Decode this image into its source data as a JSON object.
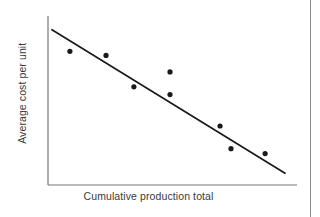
{
  "chart_data": {
    "type": "scatter",
    "title": "",
    "xlabel": "Cumulative production total",
    "ylabel": "Average cost per unit",
    "grid": false,
    "legend": null,
    "axes": {
      "x_ticks": [],
      "y_ticks": [],
      "xlim": [
        0,
        1
      ],
      "ylim": [
        0,
        1
      ],
      "spines": [
        "left",
        "bottom"
      ]
    },
    "points": [
      {
        "x": 0.088,
        "y": 0.791
      },
      {
        "x": 0.233,
        "y": 0.767
      },
      {
        "x": 0.345,
        "y": 0.581
      },
      {
        "x": 0.49,
        "y": 0.669
      },
      {
        "x": 0.49,
        "y": 0.535
      },
      {
        "x": 0.691,
        "y": 0.349
      },
      {
        "x": 0.735,
        "y": 0.215
      },
      {
        "x": 0.872,
        "y": 0.186
      }
    ],
    "trend_line": {
      "kind": "linear-fit",
      "start": {
        "x": 0.016,
        "y": 0.919
      },
      "end": {
        "x": 0.952,
        "y": 0.07
      },
      "slope_direction": "negative",
      "description": "Downward-sloping straight line of best fit"
    },
    "colors": {
      "point": "#1a1a1a",
      "line": "#1a1a1a",
      "axis": "#777777",
      "label": "#3a3a3a",
      "background": "#ffffff",
      "page_rule": "#8d8d8d"
    },
    "marker": {
      "shape": "circle",
      "radius_px": 2.6
    },
    "interpretation": "Average cost per unit falls as cumulative production total rises (experience / learning curve)."
  }
}
